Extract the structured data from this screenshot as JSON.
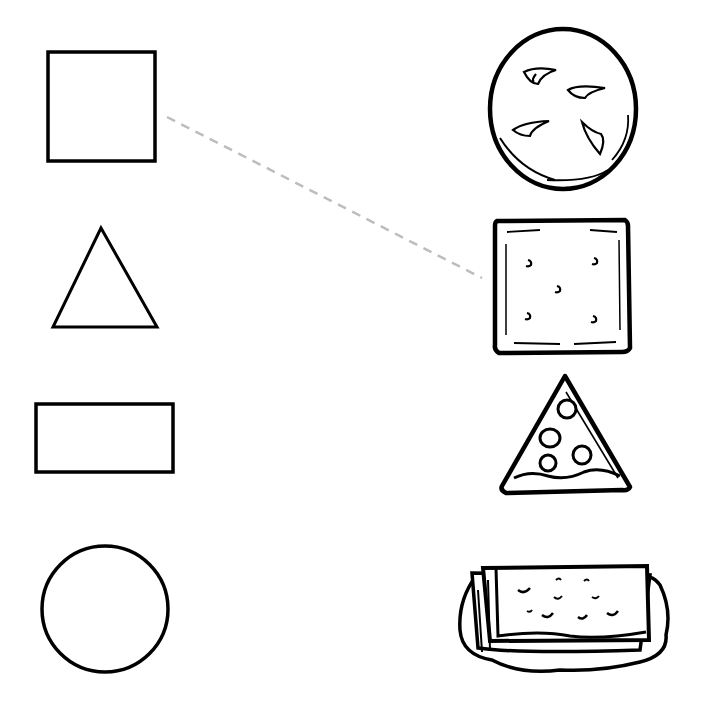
{
  "worksheet": {
    "type": "shape matching",
    "ink_color": "#000000",
    "guide_line_color": "#bdbdbd",
    "shapes": [
      {
        "id": "square",
        "label": "square"
      },
      {
        "id": "triangle",
        "label": "triangle"
      },
      {
        "id": "rectangle",
        "label": "rectangle"
      },
      {
        "id": "circle",
        "label": "circle"
      }
    ],
    "foods": [
      {
        "id": "cookie",
        "label": "round cookie"
      },
      {
        "id": "cracker",
        "label": "square cracker"
      },
      {
        "id": "pizza",
        "label": "pizza slice"
      },
      {
        "id": "sandwich",
        "label": "grilled cheese sandwich"
      }
    ],
    "connections": [
      {
        "from": "square",
        "to": "cracker",
        "style": "dashed"
      }
    ]
  }
}
